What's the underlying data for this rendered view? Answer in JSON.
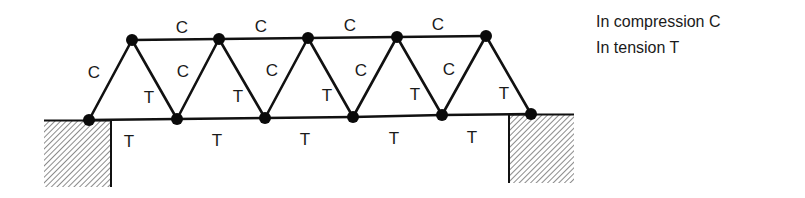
{
  "legend": {
    "compression": "In compression C",
    "tension": "In tension T"
  },
  "colors": {
    "member": "#111111",
    "node": "#0a0a0a",
    "hatch": "#6e6e6e",
    "text": "#1a1a1a"
  },
  "truss": {
    "top_nodes": [
      [
        132,
        40
      ],
      [
        219,
        39
      ],
      [
        308,
        38
      ],
      [
        397,
        37
      ],
      [
        486,
        36
      ]
    ],
    "bottom_nodes": [
      [
        89,
        120
      ],
      [
        177,
        119
      ],
      [
        265,
        118
      ],
      [
        353,
        117
      ],
      [
        442,
        115
      ],
      [
        531,
        114
      ]
    ],
    "top_chord_labels": [
      "C",
      "C",
      "C",
      "C"
    ],
    "bottom_chord_labels": [
      "T",
      "T",
      "T",
      "T",
      "T"
    ],
    "rising_diagonal_labels": [
      "C",
      "C",
      "C",
      "C",
      "C"
    ],
    "falling_diagonal_labels": [
      "T",
      "T",
      "T",
      "T",
      "T"
    ]
  },
  "labels": {
    "top": [
      {
        "text": "C",
        "x": 182,
        "y": 33
      },
      {
        "text": "C",
        "x": 261,
        "y": 32
      },
      {
        "text": "C",
        "x": 350,
        "y": 31
      },
      {
        "text": "C",
        "x": 438,
        "y": 30
      }
    ],
    "left_diagonals": [
      {
        "text": "C",
        "x": 94,
        "y": 78
      },
      {
        "text": "C",
        "x": 183,
        "y": 77
      },
      {
        "text": "C",
        "x": 272,
        "y": 76
      },
      {
        "text": "C",
        "x": 361,
        "y": 76
      },
      {
        "text": "C",
        "x": 449,
        "y": 75
      }
    ],
    "right_diagonals": [
      {
        "text": "T",
        "x": 149,
        "y": 103
      },
      {
        "text": "T",
        "x": 238,
        "y": 102
      },
      {
        "text": "T",
        "x": 327,
        "y": 101
      },
      {
        "text": "T",
        "x": 415,
        "y": 100
      },
      {
        "text": "T",
        "x": 504,
        "y": 99
      }
    ],
    "bottom": [
      {
        "text": "T",
        "x": 129,
        "y": 147
      },
      {
        "text": "T",
        "x": 217,
        "y": 146
      },
      {
        "text": "T",
        "x": 305,
        "y": 145
      },
      {
        "text": "T",
        "x": 394,
        "y": 144
      },
      {
        "text": "T",
        "x": 472,
        "y": 143
      }
    ]
  },
  "supports": {
    "left": {
      "x": 44,
      "y": 120,
      "w": 67,
      "h": 67
    },
    "right": {
      "x": 509,
      "y": 114,
      "w": 65,
      "h": 69
    }
  }
}
